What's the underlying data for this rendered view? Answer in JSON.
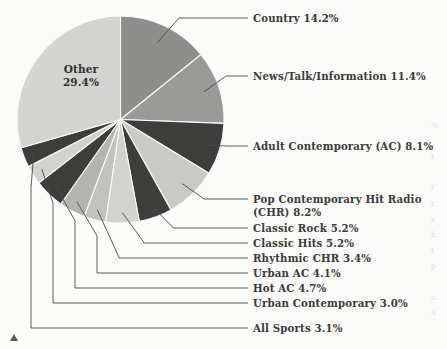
{
  "chart_data": {
    "type": "pie",
    "title": "",
    "subtitle": "",
    "xlabel": "",
    "ylabel": "",
    "legend_position": "callout-labels",
    "grid": false,
    "units": "percent",
    "start_angle_deg": 0,
    "direction": "clockwise",
    "categories": [
      "Country",
      "News/Talk/Information",
      "Adult Contemporary (AC)",
      "Pop Contemporary Hit Radio (CHR)",
      "Classic Rock",
      "Classic Hits",
      "Rhythmic CHR",
      "Urban AC",
      "Hot AC",
      "Urban Contemporary",
      "All Sports",
      "Other"
    ],
    "values": [
      14.2,
      11.4,
      8.1,
      8.2,
      5.2,
      5.2,
      3.4,
      4.1,
      4.7,
      3.0,
      3.1,
      29.4
    ],
    "slices": [
      {
        "label": "Country",
        "value": 14.2,
        "value_text": "14.2%",
        "color": "#8e8e8c"
      },
      {
        "label": "News/Talk/Information",
        "value": 11.4,
        "value_text": "11.4%",
        "color": "#9a9a98"
      },
      {
        "label": "Adult Contemporary (AC)",
        "value": 8.1,
        "value_text": "8.1%",
        "color": "#3d3d3c"
      },
      {
        "label": "Pop Contemporary Hit Radio (CHR)",
        "value": 8.2,
        "value_text": "8.2%",
        "color": "#c9c9c6"
      },
      {
        "label": "Classic Rock",
        "value": 5.2,
        "value_text": "5.2%",
        "color": "#3d3d3c"
      },
      {
        "label": "Classic Hits",
        "value": 5.2,
        "value_text": "5.2%",
        "color": "#d2d2cf"
      },
      {
        "label": "Rhythmic CHR",
        "value": 3.4,
        "value_text": "3.4%",
        "color": "#c2c2bf"
      },
      {
        "label": "Urban AC",
        "value": 4.1,
        "value_text": "4.1%",
        "color": "#b4b4b1"
      },
      {
        "label": "Hot AC",
        "value": 4.7,
        "value_text": "4.7%",
        "color": "#3d3d3c"
      },
      {
        "label": "Urban Contemporary",
        "value": 3.0,
        "value_text": "3.0%",
        "color": "#d2d2cf"
      },
      {
        "label": "All Sports",
        "value": 3.1,
        "value_text": "3.1%",
        "color": "#3d3d3c"
      },
      {
        "label": "Other",
        "value": 29.4,
        "value_text": "29.4%",
        "color": "#d4d4d1"
      }
    ]
  },
  "pie": {
    "inner_label": {
      "name": "Other",
      "percent": "29.4%",
      "text": "Other\n29.4%"
    }
  },
  "callouts": [
    {
      "id": "country",
      "text": "Country 14.2%"
    },
    {
      "id": "news-talk",
      "text": "News/Talk/Information 11.4%"
    },
    {
      "id": "adult-contemporary",
      "text": "Adult Contemporary (AC) 8.1%"
    },
    {
      "id": "pop-chr",
      "text": "Pop Contemporary Hit Radio\n(CHR) 8.2%"
    },
    {
      "id": "classic-rock",
      "text": "Classic Rock 5.2%"
    },
    {
      "id": "classic-hits",
      "text": "Classic Hits 5.2%"
    },
    {
      "id": "rhythmic-chr",
      "text": "Rhythmic CHR 3.4%"
    },
    {
      "id": "urban-ac",
      "text": "Urban AC 4.1%"
    },
    {
      "id": "hot-ac",
      "text": "Hot AC 4.7%"
    },
    {
      "id": "urban-contemporary",
      "text": "Urban Contemporary 3.0%"
    },
    {
      "id": "all-sports",
      "text": "All Sports 3.1%"
    }
  ],
  "colors": {
    "page_background": "#fbfbfa",
    "text": "#3b3b3a",
    "leader_line": "#4a4a48",
    "slice_dark": "#3d3d3c",
    "slice_mid": "#8e8e8c",
    "slice_light": "#d2d2cf"
  },
  "edge_bleed": {
    "text": "%\n \nt\n \nf\nt\nv\nh\nt\np\n \nn\na"
  }
}
